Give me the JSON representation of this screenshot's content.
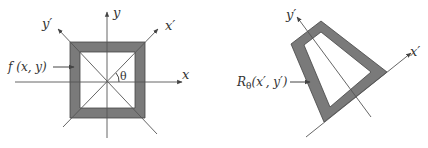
{
  "left_figure": {
    "axis_x_label": "x",
    "axis_y_label": "y",
    "axis_xp_label": "x′",
    "axis_yp_label": "y′",
    "angle_label": "θ",
    "function_label": "f (x, y)"
  },
  "right_figure": {
    "axis_xp_label": "x′",
    "axis_yp_label": "y′",
    "function_label_main": "R",
    "function_label_sub": "θ",
    "function_label_args": "(x′, y′)"
  },
  "colors": {
    "fill_gray": "#7a7a7a",
    "line": "#555555",
    "text": "#333333"
  }
}
